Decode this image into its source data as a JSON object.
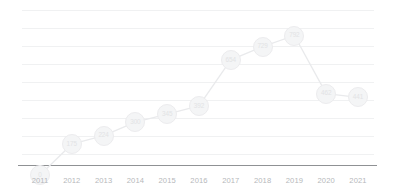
{
  "chart_data": {
    "type": "line",
    "title": "",
    "subtitle": "",
    "xlabel": "",
    "ylabel": "",
    "categories": [
      "2011",
      "2012",
      "2013",
      "2014",
      "2015",
      "2016",
      "2017",
      "2018",
      "2019",
      "2020",
      "2021"
    ],
    "values": [
      0,
      175,
      224,
      300,
      345,
      392,
      654,
      729,
      792,
      462,
      441
    ],
    "series": [
      {
        "name": "Series 1",
        "values": [
          0,
          175,
          224,
          300,
          345,
          392,
          654,
          729,
          792,
          462,
          441
        ]
      }
    ],
    "point_labels": [
      "0",
      "175",
      "224",
      "300",
      "345",
      "392",
      "654",
      "729",
      "792",
      "462",
      "441"
    ],
    "ylim": [
      0,
      880
    ],
    "xlim": [
      "2011",
      "2021"
    ],
    "grid": true,
    "gridline_count": 9,
    "legend": false,
    "legend_position": "none",
    "marker": "circle-with-value-label",
    "colors": {
      "line": "#e9eaec",
      "marker_fill": "#f4f5f6",
      "marker_stroke": "#ececee",
      "marker_label": "#e2e3e5",
      "gridline": "#f0f1f2",
      "axis": "#8f9194",
      "tick_label": "#b6b8bb",
      "background": "#ffffff"
    }
  },
  "axis": {
    "ticks": [
      "2011",
      "2012",
      "2013",
      "2014",
      "2015",
      "2016",
      "2017",
      "2018",
      "2019",
      "2020",
      "2021"
    ]
  }
}
